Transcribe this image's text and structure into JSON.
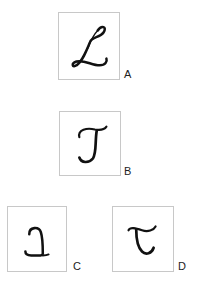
{
  "options": [
    {
      "id": "A",
      "label": "A",
      "glyph": "script-L"
    },
    {
      "id": "B",
      "label": "B",
      "glyph": "script-T"
    },
    {
      "id": "C",
      "label": "C",
      "glyph": "mirrored-rotated-script-L"
    },
    {
      "id": "D",
      "label": "D",
      "glyph": "script-T-variant"
    }
  ],
  "colors": {
    "border": "#c8c8c8",
    "ink": "#111111"
  }
}
